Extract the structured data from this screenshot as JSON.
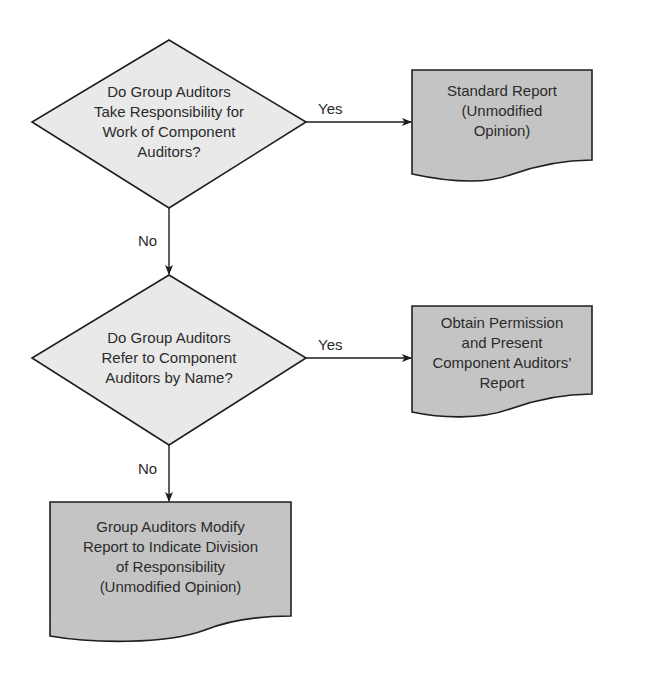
{
  "diagram": {
    "type": "flowchart",
    "colors": {
      "decision_fill": "#e9e9e9",
      "document_fill": "#c4c4c4",
      "stroke": "#1e1e1e",
      "text": "#2b2b2b",
      "background": "#ffffff"
    },
    "nodes": {
      "decision1": {
        "shape": "diamond",
        "lines": [
          "Do Group Auditors",
          "Take Responsibility for",
          "Work of Component",
          "Auditors?"
        ]
      },
      "report1": {
        "shape": "document",
        "lines": [
          "Standard Report",
          "(Unmodified",
          "Opinion)"
        ]
      },
      "decision2": {
        "shape": "diamond",
        "lines": [
          "Do Group Auditors",
          "Refer to Component",
          "Auditors by Name?"
        ]
      },
      "report2": {
        "shape": "document",
        "lines": [
          "Obtain Permission",
          "and Present",
          "Component Auditors’",
          "Report"
        ]
      },
      "report3": {
        "shape": "document",
        "lines": [
          "Group Auditors Modify",
          "Report to Indicate Division",
          "of Responsibility",
          "(Unmodified Opinion)"
        ]
      }
    },
    "edges": [
      {
        "from": "decision1",
        "to": "report1",
        "label": "Yes"
      },
      {
        "from": "decision1",
        "to": "decision2",
        "label": "No"
      },
      {
        "from": "decision2",
        "to": "report2",
        "label": "Yes"
      },
      {
        "from": "decision2",
        "to": "report3",
        "label": "No"
      }
    ]
  }
}
